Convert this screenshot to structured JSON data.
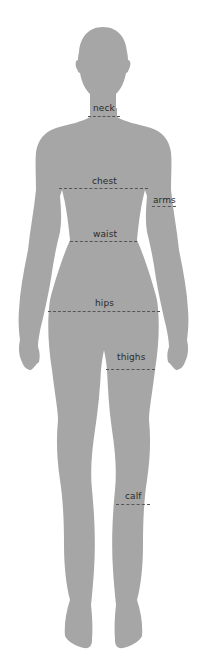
{
  "figure": {
    "silhouette_color": "#a6a6a6",
    "label_color": "#2b2b2b",
    "line_color": "#555555"
  },
  "measurements": [
    {
      "id": "neck",
      "label": "neck",
      "label_x": 93,
      "label_y": 103,
      "line_x": 88,
      "line_y": 116,
      "line_w": 32
    },
    {
      "id": "chest",
      "label": "chest",
      "label_x": 92,
      "label_y": 176,
      "line_x": 59,
      "line_y": 188,
      "line_w": 89
    },
    {
      "id": "arms",
      "label": "arms",
      "label_x": 153,
      "label_y": 195,
      "line_x": 152,
      "line_y": 206,
      "line_w": 24
    },
    {
      "id": "waist",
      "label": "waist",
      "label_x": 93,
      "label_y": 229,
      "line_x": 70,
      "line_y": 241,
      "line_w": 67
    },
    {
      "id": "hips",
      "label": "hips",
      "label_x": 95,
      "label_y": 298,
      "line_x": 48,
      "line_y": 311,
      "line_w": 112
    },
    {
      "id": "thighs",
      "label": "thighs",
      "label_x": 117,
      "label_y": 352,
      "line_x": 106,
      "line_y": 369,
      "line_w": 49
    },
    {
      "id": "calf",
      "label": "calf",
      "label_x": 125,
      "label_y": 491,
      "line_x": 116,
      "line_y": 504,
      "line_w": 34
    }
  ]
}
